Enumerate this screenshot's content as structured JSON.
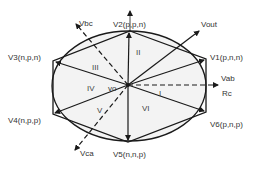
{
  "vertices": [
    {
      "id": "V1",
      "label": "V1(p,n,n)"
    },
    {
      "id": "V2",
      "label": "V2(p,p,n)"
    },
    {
      "id": "V3",
      "label": "V3(n,p,n)"
    },
    {
      "id": "V4",
      "label": "V4(n,p,p)"
    },
    {
      "id": "V5",
      "label": "V5(n,n,p)"
    },
    {
      "id": "V6",
      "label": "V6(p,n,p)"
    }
  ],
  "sectors": [
    "I",
    "II",
    "III",
    "IV",
    "V",
    "VI"
  ],
  "axes": {
    "vab": "Vab",
    "rc": "Rc",
    "vbc": "Vbc",
    "vca": "Vca"
  },
  "vout_label": "Vout",
  "origin_label": "vo",
  "colors": {
    "stroke": "#1a1a1a",
    "fill": "#f2f2f2"
  }
}
